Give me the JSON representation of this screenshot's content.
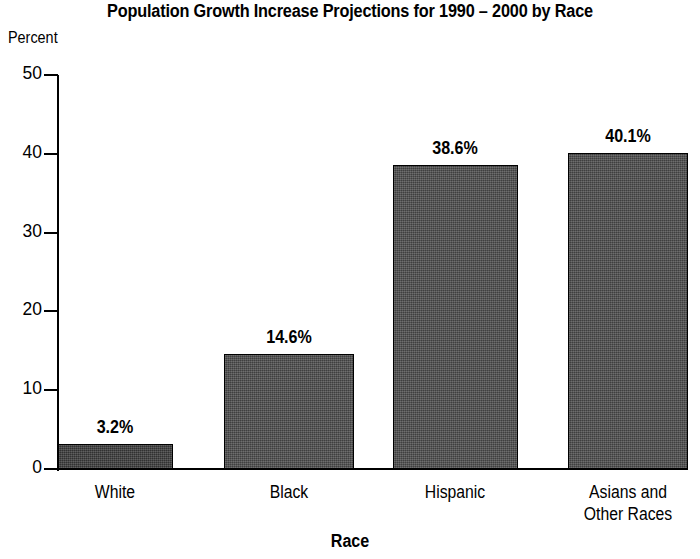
{
  "chart_data": {
    "type": "bar",
    "title": "Population Growth Increase Projections for 1990 – 2000 by Race",
    "xlabel": "Race",
    "ylabel": "Percent",
    "categories": [
      "White",
      "Black",
      "Hispanic",
      "Asians and\nOther Races"
    ],
    "values": [
      3.2,
      14.6,
      38.6,
      40.1
    ],
    "value_labels": [
      "3.2%",
      "14.6%",
      "38.6%",
      "40.1%"
    ],
    "ylim": [
      0,
      50
    ],
    "yticks": [
      0,
      10,
      20,
      30,
      40,
      50
    ],
    "ytick_labels": [
      "0",
      "10",
      "20",
      "30",
      "40",
      "50"
    ],
    "grid": false,
    "legend": false,
    "bar_color": "#4d4d4d",
    "bar_edge_color": "#000000",
    "background_color": "#ffffff",
    "text_color": "#000000"
  }
}
